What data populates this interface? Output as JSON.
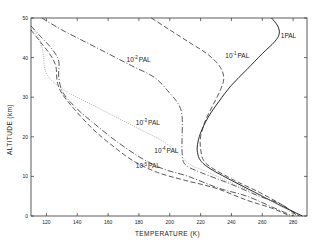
{
  "chart_data": {
    "type": "line",
    "title": "",
    "xlabel": "TEMPERATURE (K)",
    "ylabel": "ALTITUDE (km)",
    "xlim": [
      110,
      289
    ],
    "ylim": [
      0,
      50
    ],
    "x_ticks": [
      120,
      140,
      160,
      180,
      200,
      220,
      240,
      260,
      280
    ],
    "y_ticks": [
      0,
      10,
      20,
      30,
      40,
      50
    ],
    "grid": false,
    "legend": "inline labels on curves",
    "series": [
      {
        "name": "1 PAL",
        "label_base": "1",
        "label_exp": "",
        "style": "solid",
        "points": [
          [
            266,
            50
          ],
          [
            270,
            48
          ],
          [
            271,
            46
          ],
          [
            268,
            44
          ],
          [
            260,
            41
          ],
          [
            250,
            37
          ],
          [
            240,
            33
          ],
          [
            232,
            29
          ],
          [
            225,
            25
          ],
          [
            220,
            21
          ],
          [
            218,
            18
          ],
          [
            218,
            16
          ],
          [
            220,
            14
          ],
          [
            226,
            12
          ],
          [
            240,
            9
          ],
          [
            255,
            6
          ],
          [
            270,
            3
          ],
          [
            286,
            0
          ]
        ]
      },
      {
        "name": "10^-1 PAL",
        "label_base": "10",
        "label_exp": "-1",
        "style": "dashed",
        "points": [
          [
            188,
            50
          ],
          [
            200,
            47
          ],
          [
            212,
            44
          ],
          [
            224,
            41
          ],
          [
            232,
            38
          ],
          [
            235,
            35
          ],
          [
            233,
            32
          ],
          [
            228,
            28
          ],
          [
            223,
            24
          ],
          [
            220,
            20
          ],
          [
            220,
            17
          ],
          [
            222,
            14
          ],
          [
            228,
            12
          ],
          [
            242,
            9
          ],
          [
            258,
            6
          ],
          [
            272,
            3
          ],
          [
            284,
            0
          ]
        ]
      },
      {
        "name": "10^-2 PAL",
        "label_base": "10",
        "label_exp": "-2",
        "style": "dashdot",
        "points": [
          [
            117,
            50
          ],
          [
            130,
            47
          ],
          [
            145,
            44
          ],
          [
            160,
            41
          ],
          [
            175,
            38
          ],
          [
            190,
            35
          ],
          [
            200,
            31
          ],
          [
            206,
            28
          ],
          [
            208,
            25
          ],
          [
            208,
            20
          ],
          [
            208,
            16
          ],
          [
            210,
            13
          ],
          [
            220,
            11
          ],
          [
            240,
            8
          ],
          [
            258,
            5
          ],
          [
            272,
            3
          ],
          [
            283,
            0
          ]
        ]
      },
      {
        "name": "10^-3 PAL",
        "label_base": "10",
        "label_exp": "-3",
        "style": "dotted",
        "points": [
          [
            110,
            48
          ],
          [
            115,
            45
          ],
          [
            118,
            41
          ],
          [
            119,
            37
          ],
          [
            124,
            34
          ],
          [
            135,
            31
          ],
          [
            150,
            28
          ],
          [
            165,
            25
          ],
          [
            180,
            22
          ],
          [
            195,
            19
          ],
          [
            205,
            16
          ],
          [
            213,
            13
          ],
          [
            225,
            11
          ],
          [
            242,
            8
          ],
          [
            260,
            5
          ],
          [
            274,
            2
          ],
          [
            282,
            0
          ]
        ]
      },
      {
        "name": "10^-4 PAL",
        "label_base": "10",
        "label_exp": "-4",
        "style": "dashdot",
        "points": [
          [
            110,
            48
          ],
          [
            117,
            45
          ],
          [
            124,
            42
          ],
          [
            128,
            39
          ],
          [
            128,
            35
          ],
          [
            131,
            31
          ],
          [
            140,
            27
          ],
          [
            152,
            23
          ],
          [
            165,
            19
          ],
          [
            180,
            15
          ],
          [
            195,
            12
          ],
          [
            212,
            10
          ],
          [
            232,
            7
          ],
          [
            250,
            5
          ],
          [
            268,
            2
          ],
          [
            280,
            0
          ]
        ]
      },
      {
        "name": "10^-5 PAL",
        "label_base": "10",
        "label_exp": "-5",
        "style": "dashed",
        "points": [
          [
            110,
            47
          ],
          [
            116,
            44
          ],
          [
            122,
            41
          ],
          [
            126,
            38
          ],
          [
            127,
            34
          ],
          [
            130,
            31
          ],
          [
            138,
            27
          ],
          [
            150,
            22
          ],
          [
            162,
            18
          ],
          [
            176,
            14
          ],
          [
            192,
            11
          ],
          [
            210,
            9
          ],
          [
            230,
            7
          ],
          [
            250,
            4
          ],
          [
            266,
            2
          ],
          [
            278,
            0
          ]
        ]
      }
    ],
    "annotations": [
      {
        "text": "1 PAL",
        "x": 272,
        "y": 45
      },
      {
        "text": "10^-1 PAL",
        "x": 236,
        "y": 40
      },
      {
        "text": "10^-2 PAL",
        "x": 172,
        "y": 39
      },
      {
        "text": "10^-3 PAL",
        "x": 178,
        "y": 23
      },
      {
        "text": "10^-4 PAL",
        "x": 190,
        "y": 16
      },
      {
        "text": "10^-5 PAL",
        "x": 178,
        "y": 12
      }
    ]
  },
  "labels": {
    "xlabel": "TEMPERATURE (K)",
    "ylabel": "ALTITUDE (km)"
  }
}
